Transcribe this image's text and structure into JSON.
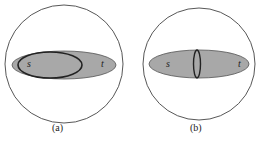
{
  "panels": [
    {
      "id": "a",
      "caption": "(a)",
      "label_s": "s",
      "label_t": "t"
    },
    {
      "id": "b",
      "caption": "(b)",
      "label_s": "s",
      "label_t": "t"
    }
  ],
  "colors": {
    "fill": "#a8a8a8",
    "stroke": "#222222",
    "background": "#ffffff"
  }
}
